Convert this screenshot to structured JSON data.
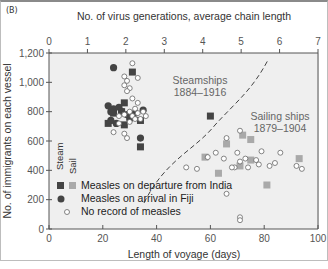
{
  "panel_label": "(B)",
  "chart_data": {
    "type": "scatter",
    "title": "",
    "xlabel": "Length of voyage (days)",
    "ylabel": "No. of immigrants on each vessel",
    "x2label": "No. of virus generations, average chain length",
    "xlim": [
      0,
      100
    ],
    "ylim": [
      0,
      1200
    ],
    "x2lim": [
      0,
      7
    ],
    "xticks": [
      "0",
      "20",
      "40",
      "60",
      "80",
      "100"
    ],
    "yticks": [
      "0",
      "200",
      "400",
      "600",
      "800",
      "1,000",
      "1,200"
    ],
    "x2ticks": [
      "0",
      "1",
      "2",
      "3",
      "4",
      "5",
      "6",
      "7"
    ],
    "grid": false,
    "annotations": [
      {
        "text": "Steamships",
        "text2": "1884–1916"
      },
      {
        "text": "Sailing ships",
        "text2": "1879–1904"
      }
    ],
    "legend": {
      "column_headers": [
        "Steam",
        "Sail"
      ],
      "entries": [
        "Measles on departure from India",
        "Measles on arrival in Fiji",
        "No record of measles"
      ]
    },
    "series": [
      {
        "name": "Steam - Measles on departure from India",
        "marker": "square-dark",
        "points": [
          [
            31,
            1070
          ],
          [
            28,
            860
          ],
          [
            27,
            800
          ],
          [
            24,
            790
          ],
          [
            22,
            720
          ],
          [
            28,
            710
          ],
          [
            34,
            740
          ],
          [
            34,
            560
          ],
          [
            60,
            770
          ]
        ]
      },
      {
        "name": "Measles on arrival in Fiji",
        "marker": "circle-dark",
        "points": [
          [
            24,
            1100
          ],
          [
            22,
            840
          ],
          [
            24,
            820
          ],
          [
            26,
            830
          ],
          [
            23,
            800
          ],
          [
            27,
            800
          ],
          [
            29,
            780
          ],
          [
            30,
            750
          ],
          [
            25,
            720
          ],
          [
            32,
            790
          ],
          [
            35,
            810
          ],
          [
            23,
            740
          ],
          [
            34,
            620
          ],
          [
            30,
            780
          ]
        ]
      },
      {
        "name": "No record of measles",
        "marker": "circle-open",
        "points": [
          [
            31,
            1130
          ],
          [
            28,
            1040
          ],
          [
            29,
            1010
          ],
          [
            33,
            1030
          ],
          [
            28,
            980
          ],
          [
            30,
            960
          ],
          [
            29,
            940
          ],
          [
            31,
            890
          ],
          [
            33,
            860
          ],
          [
            32,
            820
          ],
          [
            35,
            800
          ],
          [
            30,
            800
          ],
          [
            28,
            780
          ],
          [
            31,
            770
          ],
          [
            33,
            790
          ],
          [
            26,
            770
          ],
          [
            34,
            750
          ],
          [
            29,
            620
          ],
          [
            36,
            770
          ],
          [
            24,
            660
          ],
          [
            28,
            650
          ],
          [
            26,
            720
          ],
          [
            30,
            730
          ],
          [
            32,
            750
          ]
        ]
      },
      {
        "name": "Sail - Measles on departure from India",
        "marker": "square-light",
        "points": [
          [
            72,
            640
          ],
          [
            75,
            610
          ],
          [
            66,
            580
          ],
          [
            58,
            490
          ],
          [
            75,
            470
          ],
          [
            71,
            430
          ],
          [
            81,
            300
          ],
          [
            93,
            480
          ],
          [
            63,
            380
          ]
        ]
      },
      {
        "name": "No record of measles (sail)",
        "marker": "circle-open",
        "points": [
          [
            71,
            670
          ],
          [
            66,
            620
          ],
          [
            62,
            520
          ],
          [
            59,
            490
          ],
          [
            51,
            420
          ],
          [
            55,
            410
          ],
          [
            65,
            480
          ],
          [
            70,
            520
          ],
          [
            71,
            460
          ],
          [
            73,
            480
          ],
          [
            77,
            470
          ],
          [
            78,
            440
          ],
          [
            74,
            420
          ],
          [
            82,
            430
          ],
          [
            84,
            450
          ],
          [
            79,
            530
          ],
          [
            86,
            520
          ],
          [
            69,
            420
          ],
          [
            68,
            420
          ],
          [
            92,
            430
          ],
          [
            94,
            410
          ],
          [
            66,
            240
          ],
          [
            71,
            80
          ],
          [
            71,
            60
          ]
        ]
      }
    ]
  },
  "layout": {
    "plot_bg": "#efefef",
    "axis_color": "#555555",
    "dark_marker": "#444444",
    "light_marker": "#a9a9a9"
  }
}
